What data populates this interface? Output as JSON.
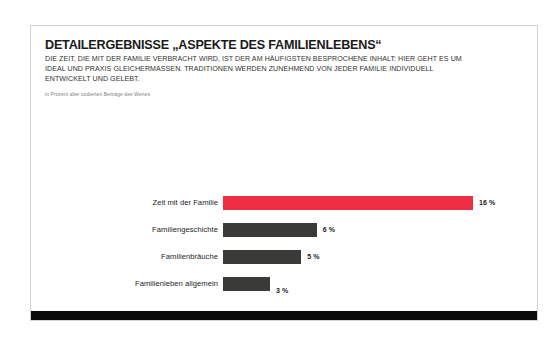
{
  "slide": {
    "title": "DETAILERGEBNISSE „ASPEKTE DES FAMILIENLEBENS“",
    "subtitle": "DIE ZEIT, DIE MIT DER FAMILIE VERBRACHT WIRD, IST DER AM HÄUFIGSTEN BESPROCHENE INHALT: HIER GEHT ES UM IDEAL UND PRAXIS GLEICHERMASSEN. TRADITIONEN WERDEN ZUNEHMEND VON JEDER FAMILIE INDIVIDUELL ENTWICKELT UND GELEBT.",
    "note": "in Prozent aller codierten Beiträge des Wertes",
    "accent_color": "#ed2e42",
    "bar_color": "#3a3a38",
    "footer_color": "#0b0b0b"
  },
  "chart_data": {
    "type": "bar",
    "orientation": "horizontal",
    "title": "DETAILERGEBNISSE „ASPEKTE DES FAMILIENLEBENS“",
    "subtitle": "DIE ZEIT, DIE MIT DER FAMILIE VERBRACHT WIRD, IST DER AM HÄUFIGSTEN BESPROCHENE INHALT: HIER GEHT ES UM IDEAL UND PRAXIS GLEICHERMASSEN. TRADITIONEN WERDEN ZUNEHMEND VON JEDER FAMILIE INDIVIDUELL ENTWICKELT UND GELEBT.",
    "xlabel": "",
    "ylabel": "",
    "unit": "%",
    "grid": false,
    "legend": false,
    "xlim": [
      0,
      16
    ],
    "categories": [
      "Zeit mit der Familie",
      "Familiengeschichte",
      "Familienbräuche",
      "Familienleben allgemein"
    ],
    "values": [
      16,
      6,
      5,
      3
    ],
    "value_labels": [
      "16 %",
      "6 %",
      "5 %",
      "3 %"
    ],
    "colors": [
      "#ed2e42",
      "#3a3a38",
      "#3a3a38",
      "#3a3a38"
    ],
    "annotations": [
      "in Prozent aller codierten Beiträge des Wertes"
    ]
  }
}
